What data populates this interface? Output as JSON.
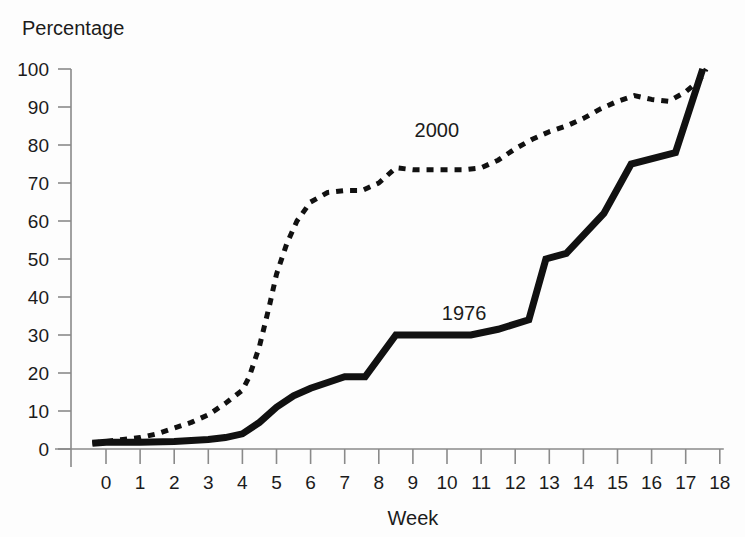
{
  "chart_data": {
    "type": "line",
    "title": "",
    "xlabel": "Week",
    "ylabel": "Percentage",
    "xlim": [
      -0.6,
      18
    ],
    "ylim": [
      0,
      100
    ],
    "grid": false,
    "legend_position": "inline-annotation",
    "xticks": [
      "0",
      "1",
      "2",
      "3",
      "4",
      "5",
      "6",
      "7",
      "8",
      "9",
      "10",
      "11",
      "12",
      "13",
      "14",
      "15",
      "16",
      "17",
      "18"
    ],
    "xtick_values": [
      0,
      1,
      2,
      3,
      4,
      5,
      6,
      7,
      8,
      9,
      10,
      11,
      12,
      13,
      14,
      15,
      16,
      17,
      18
    ],
    "yticks": [
      "0",
      "10",
      "20",
      "30",
      "40",
      "50",
      "60",
      "70",
      "80",
      "90",
      "100"
    ],
    "ytick_values": [
      0,
      10,
      20,
      30,
      40,
      50,
      60,
      70,
      80,
      90,
      100
    ],
    "series": [
      {
        "name": "2000",
        "style": "dotted",
        "color": "#111111",
        "label_x": 9.7,
        "label_y": 82,
        "x": [
          -0.4,
          0,
          0.5,
          1,
          1.5,
          2,
          2.5,
          3,
          3.5,
          4,
          4.2,
          4.5,
          4.8,
          5,
          5.3,
          5.6,
          6,
          6.5,
          7,
          7.5,
          8,
          8.5,
          9,
          9.5,
          10,
          10.5,
          11,
          11.5,
          12,
          12.5,
          13,
          13.5,
          14,
          14.5,
          15,
          15.5,
          16,
          16.5,
          17,
          17.4,
          17.6
        ],
        "y": [
          1.5,
          2,
          2.5,
          3,
          4,
          5.5,
          7,
          9,
          12,
          15.5,
          19,
          27,
          38,
          46,
          54,
          60,
          65,
          67.5,
          68,
          68,
          70,
          74,
          73.5,
          73.5,
          73.5,
          73.5,
          74,
          76,
          79,
          81.5,
          83.5,
          85,
          87,
          89.5,
          91.5,
          93,
          92,
          91.5,
          94,
          97,
          100
        ]
      },
      {
        "name": "1976",
        "style": "solid",
        "color": "#111111",
        "label_x": 10.5,
        "label_y": 34,
        "x": [
          -0.4,
          0,
          1,
          2,
          3,
          3.5,
          4,
          4.5,
          5,
          5.5,
          6,
          6.5,
          7,
          7.6,
          8.5,
          10.7,
          11.5,
          12.4,
          12.9,
          13.5,
          14.6,
          15.4,
          16.7,
          17.5
        ],
        "y": [
          1.5,
          1.8,
          1.8,
          2,
          2.5,
          3,
          4,
          7,
          11,
          14,
          16,
          17.5,
          19,
          19,
          30,
          30,
          31.5,
          34,
          50,
          51.5,
          62,
          75,
          78,
          100
        ]
      }
    ]
  }
}
